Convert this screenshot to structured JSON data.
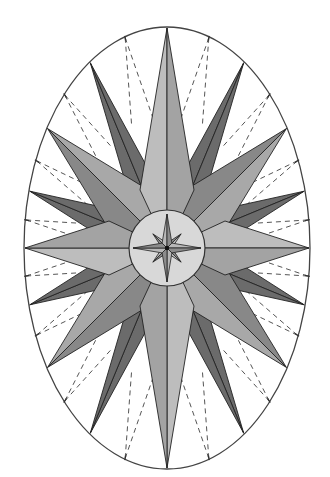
{
  "diagram": {
    "title": "",
    "type": "compass-rose",
    "canvas": {
      "width": 330,
      "height": 477,
      "background": "#ffffff"
    },
    "center": {
      "x": 167,
      "y": 248
    },
    "ellipse": {
      "rx": 143,
      "ry": 221,
      "stroke": "#444444",
      "stroke_width": 1.3,
      "fill": "#ffffff"
    },
    "inner_circle": {
      "r": 38,
      "stroke": "#333333",
      "fill": "#d6d6d6"
    },
    "colors": {
      "cardinal_light": "#bdbdbd",
      "cardinal_dark": "#a3a3a3",
      "inter_light": "#a8a8a8",
      "inter_dark": "#888888",
      "minor_point": "#6b6b6b",
      "center_fill": "#d8d8d8",
      "small_star_light": "#b8b8b8",
      "small_star_dark": "#8c8c8c",
      "outline": "#222222",
      "dash": "#555555"
    },
    "points": {
      "cardinal": {
        "angles": [
          0,
          90,
          180,
          270
        ],
        "half_width": 17,
        "base_radius": 38
      },
      "intercardinal": {
        "angles": [
          45,
          135,
          225,
          315
        ],
        "half_width": 15,
        "base_radius": 58
      },
      "minor": {
        "angles": [
          22.5,
          67.5,
          112.5,
          157.5,
          202.5,
          247.5,
          292.5,
          337.5
        ],
        "half_width": 14,
        "base_radius": 70
      }
    },
    "small_star": {
      "outer_r": 34,
      "inner_r": 7,
      "diag_r": 20
    },
    "dashed_divisions": {
      "angles": [
        11.25,
        33.75,
        56.25,
        78.75,
        101.25,
        123.75,
        146.25,
        168.75,
        191.25,
        213.75,
        236.25,
        258.75,
        281.25,
        303.75,
        326.25,
        348.75
      ],
      "inner_radius_frac": 0.6,
      "spread_deg": 5
    },
    "labels": []
  }
}
